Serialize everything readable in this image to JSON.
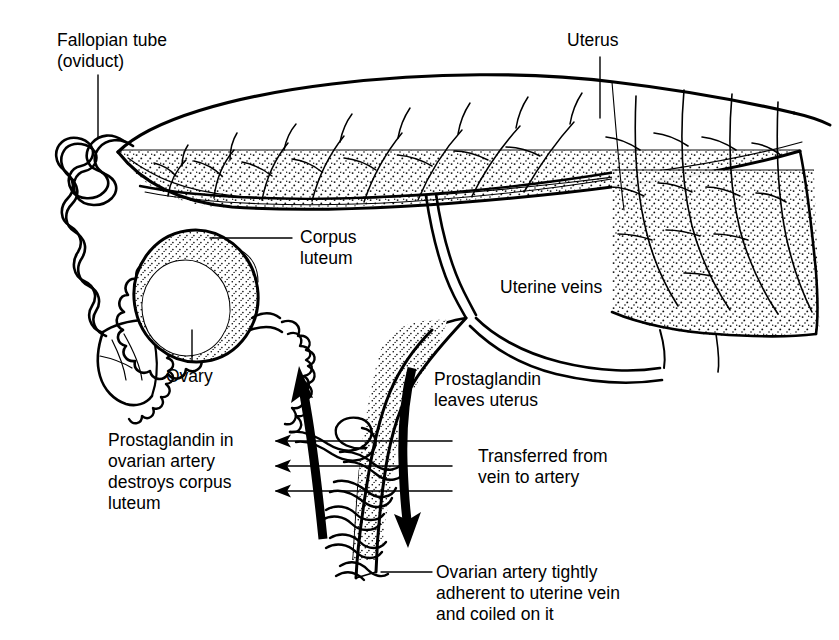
{
  "figure": {
    "kind": "anatomical-line-diagram",
    "background_color": "#ffffff",
    "ink_color": "#000000"
  },
  "labels": [
    {
      "name": "fallopian-tube",
      "line1": "Fallopian tube",
      "line2": "(oviduct)",
      "x": 57,
      "y": 30,
      "leader": "vertical-down"
    },
    {
      "name": "uterus",
      "line1": "Uterus",
      "line2": "",
      "x": 567,
      "y": 30,
      "leader": "vertical-down"
    },
    {
      "name": "corpus-luteum",
      "line1": "Corpus",
      "line2": "luteum",
      "x": 300,
      "y": 227,
      "leader": "horizontal-left"
    },
    {
      "name": "uterine-veins",
      "line1": "Uterine veins",
      "line2": "",
      "x": 500,
      "y": 277,
      "leader": "none"
    },
    {
      "name": "ovary",
      "line1": "Ovary",
      "line2": "",
      "x": 166,
      "y": 366,
      "leader": "vertical-up"
    },
    {
      "name": "prostaglandin-leaves-uterus",
      "line1": "Prostaglandin",
      "line2": "leaves uterus",
      "x": 434,
      "y": 369,
      "leader": "none"
    },
    {
      "name": "prostaglandin-destroys-corpus-luteum",
      "line1": "Prostaglandin in",
      "line2": "ovarian artery",
      "line3": "destroys corpus",
      "line4": "luteum",
      "x": 108,
      "y": 430,
      "leader": "none"
    },
    {
      "name": "transferred-vein-to-artery",
      "line1": "Transferred from",
      "line2": "vein to artery",
      "x": 478,
      "y": 446,
      "leader": "none"
    },
    {
      "name": "ovarian-artery-coiled",
      "line1": "Ovarian artery tightly",
      "line2": "adherent to uterine vein",
      "line3": "and coiled on it",
      "x": 436,
      "y": 562,
      "leader": "horizontal-left"
    }
  ],
  "leaders": [
    {
      "name": "leader-fallopian-tube",
      "x1": 98,
      "y1": 75,
      "x2": 98,
      "y2": 138
    },
    {
      "name": "leader-uterus",
      "x1": 600,
      "y1": 57,
      "x2": 600,
      "y2": 118
    },
    {
      "name": "leader-corpus-luteum",
      "x1": 210,
      "y1": 238,
      "x2": 292,
      "y2": 238
    },
    {
      "name": "leader-ovary",
      "x1": 192,
      "y1": 330,
      "x2": 192,
      "y2": 362
    },
    {
      "name": "leader-ovarian-artery",
      "x1": 381,
      "y1": 572,
      "x2": 432,
      "y2": 572
    }
  ],
  "arrows": {
    "thick": [
      {
        "name": "arrow-prostaglandin-to-ovary",
        "direction": "up",
        "from_x": 322,
        "from_y": 538,
        "to_x": 301,
        "to_y": 372,
        "meaning": "prostaglandin travels up ovarian artery toward ovary"
      },
      {
        "name": "arrow-prostaglandin-from-uterus",
        "direction": "down",
        "from_x": 411,
        "from_y": 366,
        "to_x": 406,
        "to_y": 540,
        "meaning": "prostaglandin leaves uterus down the uterine vein"
      }
    ],
    "thin_transfer": [
      {
        "name": "transfer-arrow-1",
        "y": 441,
        "x_tail": 452,
        "x_head": 272
      },
      {
        "name": "transfer-arrow-2",
        "y": 466,
        "x_tail": 452,
        "x_head": 272
      },
      {
        "name": "transfer-arrow-3",
        "y": 491,
        "x_tail": 452,
        "x_head": 272
      }
    ]
  },
  "structures": [
    {
      "name": "uterine-horn",
      "note": "long tapering horn with branching vessels and stippled ventral wall"
    },
    {
      "name": "uterine-body",
      "note": "right-hand broad stippled region with arborising vessels"
    },
    {
      "name": "fallopian-tube",
      "note": "convoluted serpentine tube at far left"
    },
    {
      "name": "infundibulum",
      "note": "fimbriated funnel beside the ovary"
    },
    {
      "name": "corpus-luteum",
      "note": "scalloped crenate body on the ovary surface"
    },
    {
      "name": "ovary",
      "note": "stippled ovoid body"
    },
    {
      "name": "ovarian-artery",
      "note": "fine artery coiled tightly around the uterine vein"
    },
    {
      "name": "uterine-vein",
      "note": "broad stippled vein descending from the uterine veins junction"
    },
    {
      "name": "uterine-veins-junction",
      "note": "Y junction where the two uterine veins converge"
    }
  ]
}
